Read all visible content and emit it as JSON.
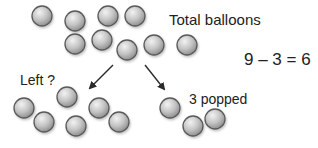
{
  "labels": {
    "total": "Total balloons",
    "equation": "9 – 3 = 6",
    "left": "Left ?",
    "popped": "3 popped"
  },
  "colors": {
    "balloon_light": "#f2f2f2",
    "balloon_mid": "#c4c4c4",
    "balloon_dark": "#8e8e8e",
    "balloon_outline": "#5a5a5a",
    "arrow": "#2a2a2a",
    "text": "#222222"
  },
  "balloon_radius": 10,
  "groups": {
    "total": [
      {
        "x": 42,
        "y": 16
      },
      {
        "x": 75,
        "y": 21
      },
      {
        "x": 108,
        "y": 16
      },
      {
        "x": 135,
        "y": 16
      },
      {
        "x": 75,
        "y": 44
      },
      {
        "x": 102,
        "y": 40
      },
      {
        "x": 127,
        "y": 50
      },
      {
        "x": 154,
        "y": 45
      },
      {
        "x": 187,
        "y": 45
      }
    ],
    "left": [
      {
        "x": 24,
        "y": 108
      },
      {
        "x": 67,
        "y": 97
      },
      {
        "x": 44,
        "y": 122
      },
      {
        "x": 99,
        "y": 108
      },
      {
        "x": 76,
        "y": 126
      },
      {
        "x": 119,
        "y": 122
      }
    ],
    "popped": [
      {
        "x": 170,
        "y": 108
      },
      {
        "x": 193,
        "y": 126
      },
      {
        "x": 215,
        "y": 119
      }
    ]
  },
  "arrows": [
    {
      "name": "arrow-to-left",
      "x1": 113,
      "y1": 65,
      "x2": 90,
      "y2": 88
    },
    {
      "name": "arrow-to-popped",
      "x1": 145,
      "y1": 65,
      "x2": 164,
      "y2": 89
    }
  ]
}
